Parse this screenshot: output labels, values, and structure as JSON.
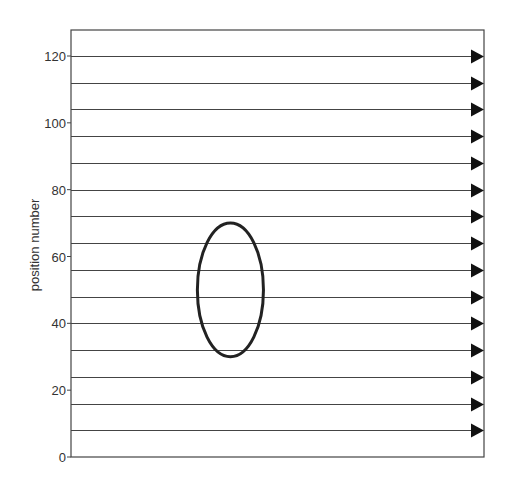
{
  "chart_data": {
    "type": "diagram",
    "title": "",
    "xlabel": "",
    "ylabel": "position number",
    "ylim": [
      0,
      128
    ],
    "yticks": [
      0,
      20,
      40,
      60,
      80,
      100,
      120
    ],
    "ytick_labels": [
      "0",
      "20",
      "40",
      "60",
      "80",
      "100",
      "120"
    ],
    "arrow_rows": [
      8,
      16,
      24,
      32,
      40,
      48,
      56,
      64,
      72,
      80,
      88,
      96,
      104,
      112,
      120
    ],
    "arrow_direction": "right",
    "ellipse": {
      "center_y": 50,
      "y_min": 30,
      "y_max": 70,
      "x_fraction_center": 0.386,
      "x_fraction_halfwidth": 0.08
    },
    "grid": false,
    "colors": {
      "lines": "#444444",
      "arrowheads": "#111111",
      "ellipse": "#222222",
      "frame": "#444444"
    }
  },
  "axis": {
    "ylabel": "position number",
    "ticks": [
      "0",
      "20",
      "40",
      "60",
      "80",
      "100",
      "120"
    ]
  }
}
